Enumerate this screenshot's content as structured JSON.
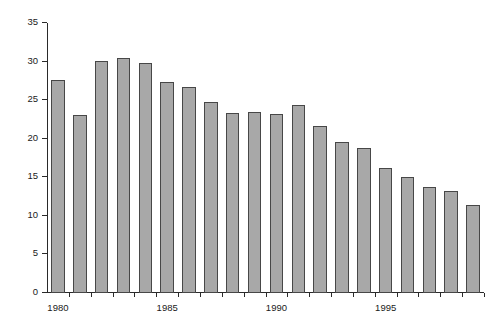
{
  "chart_data": {
    "type": "bar",
    "title": "",
    "xlabel": "",
    "ylabel": "Percent",
    "ylim": [
      0,
      35
    ],
    "ytick_values": [
      0,
      5,
      10,
      15,
      20,
      25,
      30,
      35
    ],
    "ytick_labels": [
      "0",
      "5",
      "10",
      "15",
      "20",
      "25",
      "30",
      "35"
    ],
    "xtick_labels": [
      "1980",
      "1985",
      "1990",
      "1995"
    ],
    "xtick_categories": [
      "1980",
      "1985",
      "1990",
      "1995"
    ],
    "grid": false,
    "legend": null,
    "categories": [
      "1980",
      "1981",
      "1982",
      "1983",
      "1984",
      "1985",
      "1986",
      "1987",
      "1988",
      "1989",
      "1990",
      "1991",
      "1992",
      "1993",
      "1994",
      "1995",
      "1996",
      "1997",
      "1998",
      "1999"
    ],
    "values": [
      27.6,
      23.1,
      30.1,
      30.5,
      29.8,
      27.3,
      26.7,
      24.8,
      23.4,
      23.5,
      23.2,
      24.4,
      21.6,
      19.6,
      18.8,
      16.2,
      15.1,
      13.8,
      13.2,
      11.4
    ],
    "bar_fill_color": "#a8a8a8",
    "bar_edge_color": "#474747",
    "axis_color": "#2a2a2a",
    "background_color": "#ffffff"
  }
}
